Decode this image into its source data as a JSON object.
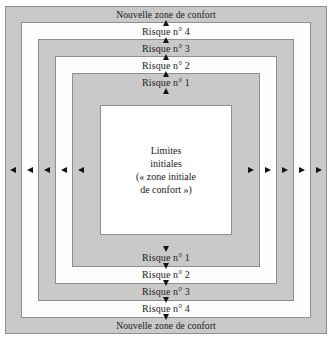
{
  "diagram": {
    "title_semantic": "concentric-comfort-zone-risk-diagram",
    "colors": {
      "band_gray": "#c9c9c9",
      "band_white": "#fdfdfd",
      "core_white": "#ffffff",
      "border": "#8f8f8f",
      "arrow": "#141414",
      "text": "#1a1a1a"
    },
    "bands": [
      {
        "id": "outer",
        "fill": "gray",
        "label": "Nouvelle zone de confort"
      },
      {
        "id": "risk4",
        "fill": "white",
        "label": "Risque n° 4"
      },
      {
        "id": "risk3",
        "fill": "gray",
        "label": "Risque n° 3"
      },
      {
        "id": "risk2",
        "fill": "white",
        "label": "Risque n° 2"
      },
      {
        "id": "risk1",
        "fill": "gray",
        "label": "Risque n° 1"
      }
    ],
    "top_labels": [
      "Nouvelle zone de confort",
      "Risque n° 4",
      "Risque n° 3",
      "Risque n° 2",
      "Risque n° 1"
    ],
    "bottom_labels": [
      "Risque n° 1",
      "Risque n° 2",
      "Risque n° 3",
      "Risque n° 4",
      "Nouvelle zone de confort"
    ],
    "core": {
      "line1": "Limites",
      "line2": "initiales",
      "line3": "(« zone initiale",
      "line4": "de confort »)"
    },
    "arrows": {
      "up_count": 5,
      "down_count": 5,
      "left_count": 5,
      "right_count": 5,
      "up_name": "arrow-up-icon",
      "down_name": "arrow-down-icon",
      "left_name": "arrow-left-icon",
      "right_name": "arrow-right-icon"
    }
  }
}
